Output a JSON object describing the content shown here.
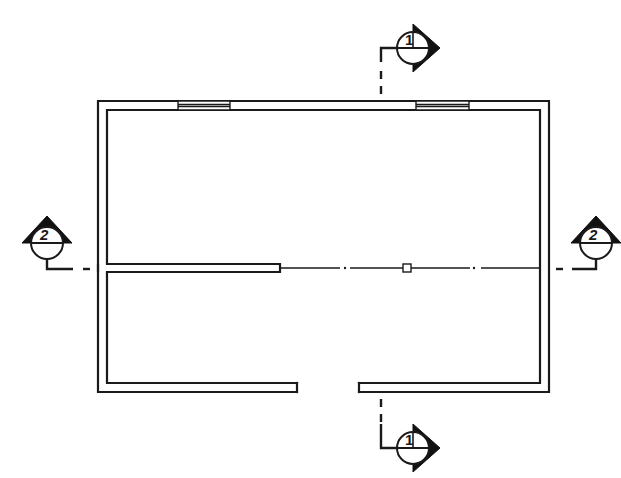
{
  "drawing": {
    "type": "floor-plan",
    "colors": {
      "line": "#1a1a1a",
      "background": "#ffffff"
    },
    "building": {
      "outer": {
        "x1": 98,
        "y1": 101,
        "x2": 549,
        "y2": 392
      },
      "inner": {
        "x1": 107,
        "y1": 110,
        "x2": 540,
        "y2": 383
      }
    },
    "windows": [
      {
        "wall": "top",
        "x1": 178,
        "x2": 230
      },
      {
        "wall": "top",
        "x2": 469,
        "x1": 416
      }
    ],
    "door_opening": {
      "wall": "bottom",
      "x1": 297,
      "x2": 359
    },
    "partition": {
      "x1": 107,
      "x2": 280,
      "y": 268
    },
    "column_marker": {
      "x": 407,
      "y": 268,
      "size": 8
    },
    "section_markers": [
      {
        "id": "section-1-top",
        "label": "1",
        "position": "top",
        "cx": 413,
        "cy": 48,
        "arrow": "right"
      },
      {
        "id": "section-1-bottom",
        "label": "1",
        "position": "bottom",
        "cx": 413,
        "cy": 448,
        "arrow": "right"
      },
      {
        "id": "section-2-left",
        "label": "2",
        "position": "left",
        "cx": 47,
        "cy": 243,
        "arrow": "up"
      },
      {
        "id": "section-2-right",
        "label": "2",
        "position": "right",
        "cx": 596,
        "cy": 243,
        "arrow": "up"
      }
    ]
  },
  "labels": {
    "section_1_top": "1",
    "section_1_bottom": "1",
    "section_2_left": "2",
    "section_2_right": "2"
  }
}
